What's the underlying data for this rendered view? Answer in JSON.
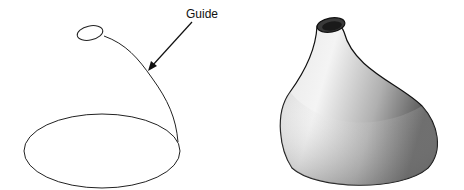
{
  "figure": {
    "left_panel": {
      "label": "Guide",
      "description": "Wireframe: base ellipse, guide curve and small top ellipse",
      "stroke_color": "#222222"
    },
    "right_panel": {
      "description": "Shaded lofted solid following the guide",
      "shade_light": "#f2f2f2",
      "shade_mid": "#bdbdbd",
      "shade_dark": "#5a5a5a",
      "outline_color": "#111111"
    }
  }
}
